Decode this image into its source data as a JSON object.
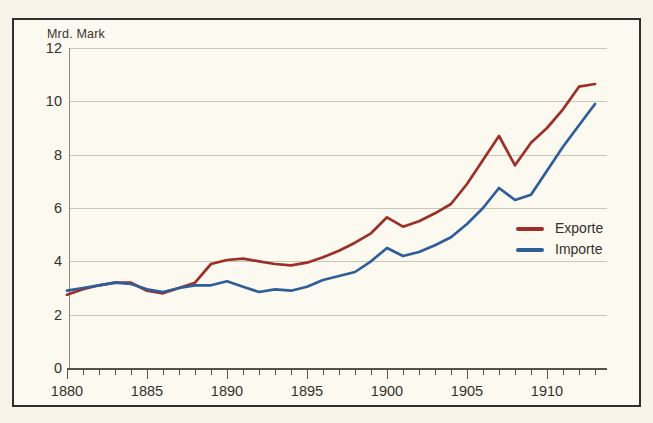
{
  "figure": {
    "unit_label": "Mrd. Mark",
    "y_ticks": [
      0,
      2,
      4,
      6,
      8,
      10,
      12
    ],
    "x_tick_labels": [
      "1880",
      "1885",
      "1890",
      "1895",
      "1900",
      "1905",
      "1910"
    ]
  },
  "chart_data": {
    "type": "line",
    "title": "",
    "xlabel": "",
    "ylabel": "Mrd. Mark",
    "xlim": [
      1880,
      1913
    ],
    "ylim": [
      0,
      12
    ],
    "grid": "horizontal",
    "legend_position": "right-middle",
    "x": [
      1880,
      1881,
      1882,
      1883,
      1884,
      1885,
      1886,
      1887,
      1888,
      1889,
      1890,
      1891,
      1892,
      1893,
      1894,
      1895,
      1896,
      1897,
      1898,
      1899,
      1900,
      1901,
      1902,
      1903,
      1904,
      1905,
      1906,
      1907,
      1908,
      1909,
      1910,
      1911,
      1912,
      1913
    ],
    "series": [
      {
        "name": "Exporte",
        "color": "#9d2f26",
        "values": [
          2.75,
          2.95,
          3.1,
          3.2,
          3.2,
          2.9,
          2.8,
          3.0,
          3.2,
          3.9,
          4.05,
          4.1,
          4.0,
          3.9,
          3.85,
          3.95,
          4.15,
          4.4,
          4.7,
          5.05,
          5.65,
          5.3,
          5.5,
          5.8,
          6.15,
          6.9,
          7.8,
          8.7,
          7.6,
          8.45,
          9.0,
          9.7,
          10.55,
          10.65
        ]
      },
      {
        "name": "Importe",
        "color": "#2e5e99",
        "values": [
          2.9,
          3.0,
          3.1,
          3.2,
          3.15,
          2.95,
          2.85,
          3.0,
          3.1,
          3.1,
          3.25,
          3.05,
          2.85,
          2.95,
          2.9,
          3.05,
          3.3,
          3.45,
          3.6,
          4.0,
          4.5,
          4.2,
          4.35,
          4.6,
          4.9,
          5.4,
          6.0,
          6.75,
          6.3,
          6.5,
          7.4,
          8.3,
          9.1,
          9.9
        ]
      }
    ]
  },
  "colors": {
    "background": "#f8f4ea",
    "plot_background": "#fcf9f1",
    "frame_border": "#312f2a",
    "gridline": "#c9c5ba",
    "axis": "#56524a",
    "text": "#35312b"
  }
}
